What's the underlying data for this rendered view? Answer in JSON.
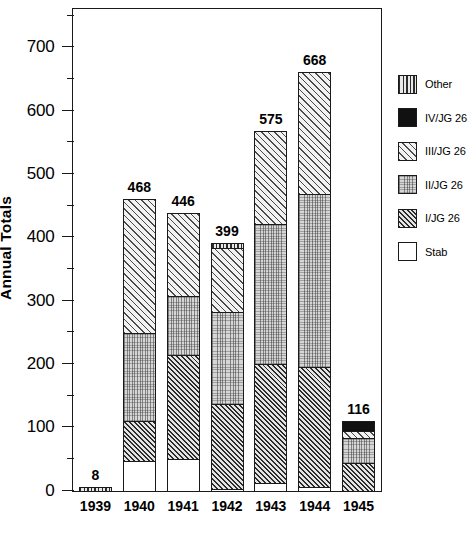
{
  "chart_data": {
    "type": "bar",
    "subtype": "stacked-bar",
    "title": "",
    "xlabel": "",
    "ylabel": "Annual Totals",
    "ylim": [
      0,
      760
    ],
    "yticks": [
      0,
      100,
      200,
      300,
      400,
      500,
      600,
      700
    ],
    "ytick_labels": [
      "0",
      "100",
      "200",
      "300",
      "400",
      "500",
      "600",
      "700"
    ],
    "yminor_ticks": [
      50,
      150,
      250,
      350,
      450,
      550,
      650,
      750
    ],
    "grid": false,
    "legend_position": "right",
    "categories": [
      "1939",
      "1940",
      "1941",
      "1942",
      "1943",
      "1944",
      "1945"
    ],
    "series": [
      {
        "name": "Stab",
        "values": [
          0,
          48,
          51,
          5,
          13,
          7,
          0
        ]
      },
      {
        "name": "I/JG 26",
        "values": [
          0,
          65,
          167,
          136,
          191,
          192,
          45
        ]
      },
      {
        "name": "II/JG 26",
        "values": [
          0,
          142,
          94,
          146,
          222,
          275,
          42
        ]
      },
      {
        "name": "III/JG 26",
        "values": [
          0,
          213,
          134,
          104,
          149,
          194,
          12
        ]
      },
      {
        "name": "IV/JG 26",
        "values": [
          0,
          0,
          0,
          0,
          0,
          0,
          17
        ]
      },
      {
        "name": "Other",
        "values": [
          8,
          0,
          0,
          8,
          0,
          0,
          0
        ]
      }
    ],
    "totals": [
      8,
      468,
      446,
      399,
      575,
      668,
      116
    ],
    "total_labels": [
      "8",
      "468",
      "446",
      "399",
      "575",
      "668",
      "116"
    ]
  },
  "legend": {
    "items": [
      {
        "label": "Other",
        "pattern": "vertical-stripes"
      },
      {
        "label": "IV/JG 26",
        "pattern": "solid-black"
      },
      {
        "label": "III/JG 26",
        "pattern": "light-diagonal-hatch"
      },
      {
        "label": "II/JG 26",
        "pattern": "stipple-dots"
      },
      {
        "label": "I/JG 26",
        "pattern": "dark-diagonal-hatch"
      },
      {
        "label": "Stab",
        "pattern": "white-empty"
      }
    ]
  },
  "colors": {
    "axis": "#1a1a1a",
    "background": "#ffffff",
    "text": "#000000"
  }
}
